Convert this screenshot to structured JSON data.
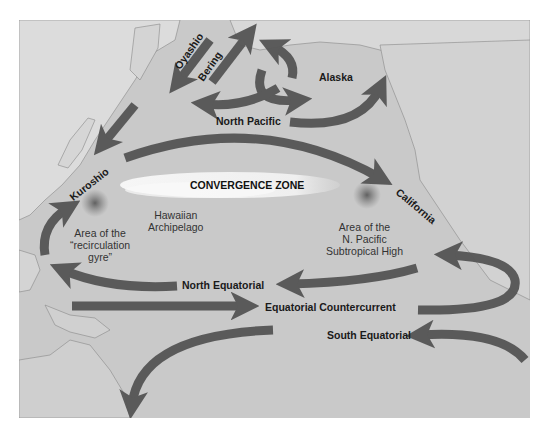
{
  "map": {
    "title_region": "North Pacific Ocean surface currents",
    "colors": {
      "ocean": "#c9c9c9",
      "land": "#dcdcdc",
      "arrow": "#555555",
      "convergence_zone": "#f2f2f2",
      "subtropical_high": "#6e6e6e"
    },
    "currents": [
      {
        "id": "oyashio",
        "label": "Oyashio"
      },
      {
        "id": "bering",
        "label": "Bering"
      },
      {
        "id": "alaska",
        "label": "Alaska"
      },
      {
        "id": "north_pacific",
        "label": "North Pacific"
      },
      {
        "id": "kuroshio",
        "label": "Kuroshio"
      },
      {
        "id": "california",
        "label": "California"
      },
      {
        "id": "north_equatorial",
        "label": "North Equatorial"
      },
      {
        "id": "equatorial_countercurrent",
        "label": "Equatorial Countercurrent"
      },
      {
        "id": "south_equatorial",
        "label": "South Equatorial"
      }
    ],
    "zones": {
      "convergence": "CONVERGENCE ZONE"
    },
    "areas": {
      "hawaiian_line1": "Hawaiian",
      "hawaiian_line2": "Archipelago",
      "recirc_line1": "Area of the",
      "recirc_line2": "“recirculation",
      "recirc_line3": "gyre”",
      "high_line1": "Area of the",
      "high_line2": "N. Pacific",
      "high_line3": "Subtropical High"
    }
  }
}
